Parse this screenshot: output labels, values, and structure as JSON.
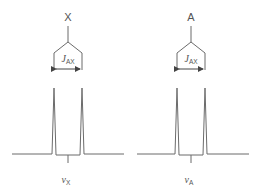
{
  "diagram": {
    "type": "nmr-doublet-splitting",
    "colors": {
      "line": "#6b6b6b",
      "text": "#555555",
      "background": "#ffffff"
    },
    "groups": [
      {
        "nucleus_label": "X",
        "coupling_label": "J",
        "coupling_subscript": "AX",
        "shift_label": "ν",
        "shift_subscript": "X",
        "center_x": 68,
        "peaks_x": [
          54,
          82
        ]
      },
      {
        "nucleus_label": "A",
        "coupling_label": "J",
        "coupling_subscript": "AX",
        "shift_label": "ν",
        "shift_subscript": "A",
        "center_x": 191,
        "peaks_x": [
          177,
          205
        ]
      }
    ]
  }
}
